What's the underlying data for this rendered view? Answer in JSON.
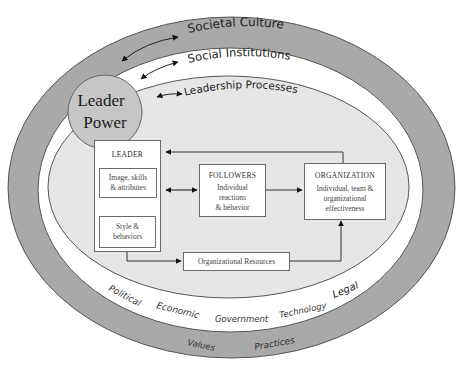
{
  "diagram": {
    "colors": {
      "background": "#ffffff",
      "outer_ring": "#a9a9a9",
      "middle_ring": "#ffffff",
      "inner_area": "#e6e6e6",
      "leader_power_circle": "#c6c6c6",
      "stroke": "#555555",
      "box_fill": "#ffffff"
    },
    "rings": {
      "societal_culture": "Societal Culture",
      "social_institutions": "Social Institutions",
      "leadership_processes": "Leadership Processes"
    },
    "leader_power": {
      "line1": "Leader",
      "line2": "Power"
    },
    "leader_box": {
      "title": "LEADER",
      "image_box": {
        "line1": "Image, skills",
        "line2": "& attributes"
      },
      "style_box": {
        "line1": "Style &",
        "line2": "behaviors"
      }
    },
    "followers_box": {
      "title": "FOLLOWERS",
      "line1": "Individual",
      "line2": "reactions",
      "line3": "& behavior"
    },
    "organization_box": {
      "title": "ORGANIZATION",
      "line1": "Individual, team &",
      "line2": "organizational",
      "line3": "effectiveness"
    },
    "resources_box": {
      "label": "Organizational Resources"
    },
    "institution_labels": [
      "Political",
      "Economic",
      "Government",
      "Technology",
      "Legal"
    ],
    "culture_labels": [
      "Values",
      "Practices"
    ]
  }
}
